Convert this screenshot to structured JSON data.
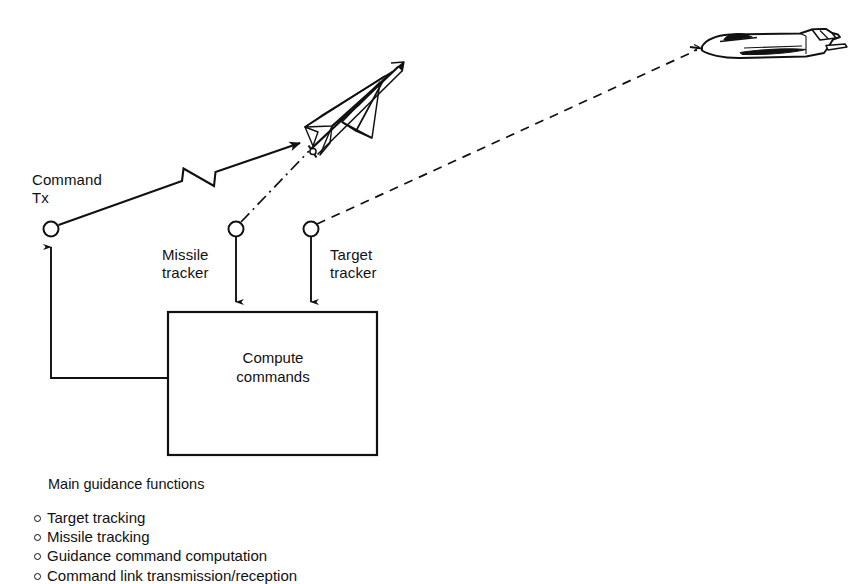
{
  "figure": {
    "kind": "command-guidance-schematic",
    "stroke_color": "#111111",
    "background_color": "#ffffff"
  },
  "labels": {
    "command_tx": "Command\nTx",
    "missile_tracker": "Missile\ntracker",
    "target_tracker": "Target\ntracker",
    "compute_commands": "Compute\ncommands"
  },
  "functions_list": {
    "heading": "Main guidance functions",
    "items": [
      "Target tracking",
      "Missile tracking",
      "Guidance command computation",
      "Command link transmission/reception"
    ]
  },
  "icons": {
    "missile": "missile-icon",
    "aircraft": "fighter-aircraft-icon",
    "antenna_command_tx": "antenna-icon",
    "antenna_missile_tracker": "antenna-icon",
    "antenna_target_tracker": "antenna-icon",
    "command_link": "command-link-zigzag-icon"
  }
}
